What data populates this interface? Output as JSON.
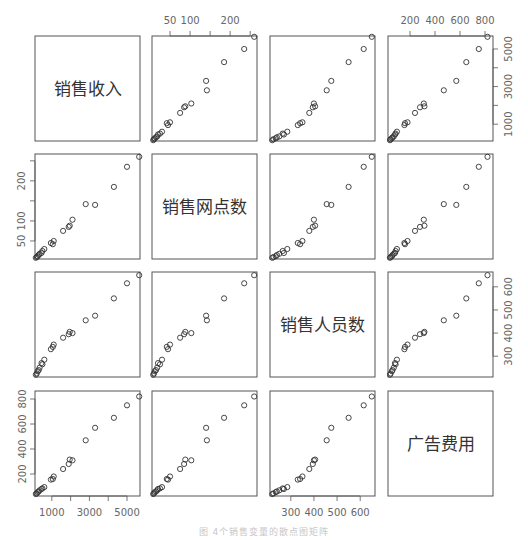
{
  "chart_data": {
    "type": "scatter",
    "subtype": "scatterplot-matrix",
    "title": "",
    "caption": "图 4个销售变量的散点图矩阵",
    "variables": [
      {
        "key": "S",
        "label": "销售收入",
        "range": [
          105,
          5690
        ],
        "ticks": [
          1000,
          2000,
          3000,
          4000,
          5000
        ],
        "tick_labels": [
          "1000",
          "",
          "3000",
          "",
          "5000"
        ]
      },
      {
        "key": "N",
        "label": "销售网点数",
        "range": [
          5,
          267
        ],
        "ticks": [
          50,
          100,
          150,
          200,
          250
        ],
        "tick_labels": [
          "50",
          "100",
          "",
          "200",
          ""
        ]
      },
      {
        "key": "P",
        "label": "销售人员数",
        "range": [
          210,
          664
        ],
        "ticks": [
          300,
          400,
          500,
          600
        ],
        "tick_labels": [
          "300",
          "400",
          "500",
          "600"
        ]
      },
      {
        "key": "A",
        "label": "广告费用",
        "range": [
          24,
          864
        ],
        "ticks": [
          200,
          400,
          600,
          800
        ],
        "tick_labels": [
          "200",
          "400",
          "600",
          "800"
        ]
      }
    ],
    "axis_placement": {
      "top": [
        1,
        3
      ],
      "bottom": [
        0,
        2
      ],
      "left": [
        1,
        3
      ],
      "right": [
        0,
        2
      ]
    },
    "points": [
      {
        "S": 5650,
        "N": 260,
        "P": 650,
        "A": 820
      },
      {
        "S": 5000,
        "N": 235,
        "P": 615,
        "A": 750
      },
      {
        "S": 4300,
        "N": 185,
        "P": 550,
        "A": 650
      },
      {
        "S": 3300,
        "N": 140,
        "P": 475,
        "A": 570
      },
      {
        "S": 2800,
        "N": 142,
        "P": 455,
        "A": 470
      },
      {
        "S": 2100,
        "N": 103,
        "P": 400,
        "A": 310
      },
      {
        "S": 1950,
        "N": 88,
        "P": 405,
        "A": 315
      },
      {
        "S": 1900,
        "N": 85,
        "P": 395,
        "A": 280
      },
      {
        "S": 1600,
        "N": 75,
        "P": 380,
        "A": 240
      },
      {
        "S": 1100,
        "N": 50,
        "P": 350,
        "A": 180
      },
      {
        "S": 950,
        "N": 45,
        "P": 330,
        "A": 155
      },
      {
        "S": 1050,
        "N": 42,
        "P": 340,
        "A": 160
      },
      {
        "S": 600,
        "N": 30,
        "P": 285,
        "A": 95
      },
      {
        "S": 500,
        "N": 25,
        "P": 265,
        "A": 85
      },
      {
        "S": 450,
        "N": 20,
        "P": 270,
        "A": 80
      },
      {
        "S": 350,
        "N": 18,
        "P": 250,
        "A": 70
      },
      {
        "S": 300,
        "N": 15,
        "P": 240,
        "A": 60
      },
      {
        "S": 250,
        "N": 12,
        "P": 235,
        "A": 55
      },
      {
        "S": 200,
        "N": 10,
        "P": 225,
        "A": 45
      },
      {
        "S": 150,
        "N": 8,
        "P": 220,
        "A": 40
      }
    ],
    "marker": "open-circle",
    "grid": false,
    "legend": null
  },
  "layout": {
    "col_x": [
      35,
      152,
      270,
      388
    ],
    "row_y": [
      36,
      154,
      272,
      391
    ],
    "panel_w": 105,
    "panel_h": 105,
    "frame_color": "#555555",
    "point_color": "#333333",
    "tick_color": "#555555",
    "label_color": "#666666"
  }
}
